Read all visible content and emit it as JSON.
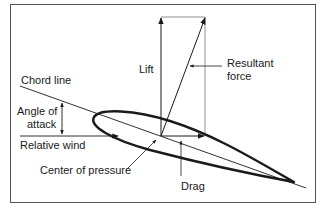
{
  "diagram": {
    "labels": {
      "lift": "Lift",
      "resultant_line1": "Resultant",
      "resultant_line2": "force",
      "chord_line": "Chord line",
      "angle_line1": "Angle of",
      "angle_line2": "attack",
      "relative_wind": "Relative wind",
      "center_of_pressure": "Center of pressure",
      "drag": "Drag"
    },
    "colors": {
      "stroke": "#1a1a1a",
      "frame": "#555555",
      "background": "#ffffff"
    }
  }
}
